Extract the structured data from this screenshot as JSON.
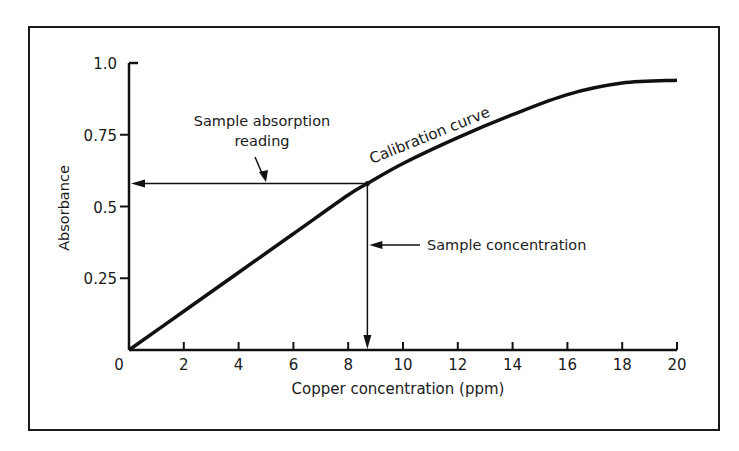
{
  "chart_data": {
    "type": "line",
    "title": "",
    "xlabel": "Copper concentration (ppm)",
    "ylabel": "Absorbance",
    "xlim": [
      0,
      20
    ],
    "ylim": [
      0,
      1.0
    ],
    "x_ticks": [
      0,
      2,
      4,
      6,
      8,
      10,
      12,
      14,
      16,
      18,
      20
    ],
    "x_tick_labels": [
      "0",
      "2",
      "4",
      "6",
      "8",
      "10",
      "12",
      "14",
      "16",
      "18",
      "20"
    ],
    "y_ticks": [
      0.25,
      0.5,
      0.75,
      1.0
    ],
    "y_tick_labels": [
      "0.25",
      "0.5",
      "0.75",
      "1.0"
    ],
    "grid": false,
    "legend": "none",
    "series": [
      {
        "name": "Calibration curve",
        "x": [
          0,
          2,
          4,
          6,
          8,
          8.7,
          10,
          12,
          14,
          16,
          18,
          20
        ],
        "y": [
          0,
          0.135,
          0.27,
          0.405,
          0.54,
          0.58,
          0.65,
          0.74,
          0.82,
          0.89,
          0.93,
          0.94
        ]
      }
    ],
    "annotations": [
      {
        "text": "Calibration curve",
        "type": "curve-label"
      },
      {
        "text": "Sample absorption reading",
        "type": "arrow-label",
        "value": 0.58
      },
      {
        "text": "Sample concentration",
        "type": "arrow-label",
        "value": 8.7
      }
    ],
    "sample_point": {
      "x": 8.7,
      "y": 0.58
    }
  },
  "labels": {
    "curve": "Calibration curve",
    "absorption_line1": "Sample absorption",
    "absorption_line2": "reading",
    "concentration": "Sample concentration",
    "xlabel": "Copper concentration (ppm)",
    "ylabel": "Absorbance",
    "origin": "0"
  }
}
